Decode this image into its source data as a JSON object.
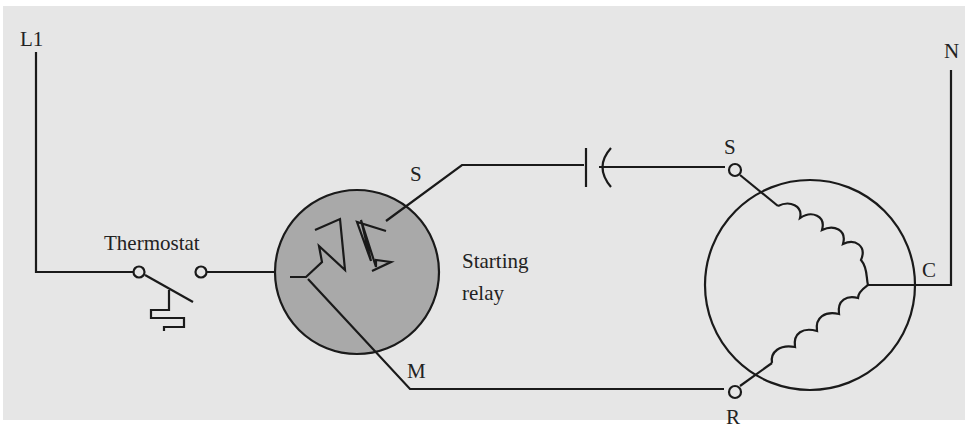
{
  "diagram": {
    "type": "electrical-wiring-schematic",
    "colors": {
      "panel_background": "#e6e6e6",
      "relay_fill": "#a9a9a9",
      "wire": "#1a1a1a",
      "text": "#222222"
    },
    "labels": {
      "line_terminal": "L1",
      "neutral_terminal": "N",
      "thermostat": "Thermostat",
      "relay_s_terminal": "S",
      "relay_m_terminal": "M",
      "relay_name_line1": "Starting",
      "relay_name_line2": "relay",
      "motor_start_terminal": "S",
      "motor_common_terminal": "C",
      "motor_run_terminal": "R"
    },
    "components": [
      {
        "id": "thermostat",
        "symbol": "bimetal-switch"
      },
      {
        "id": "starting-relay",
        "symbol": "current-relay-circle"
      },
      {
        "id": "start-capacitor",
        "symbol": "capacitor"
      },
      {
        "id": "compressor-motor",
        "symbol": "split-phase-motor",
        "windings": [
          "start",
          "run"
        ]
      }
    ]
  }
}
